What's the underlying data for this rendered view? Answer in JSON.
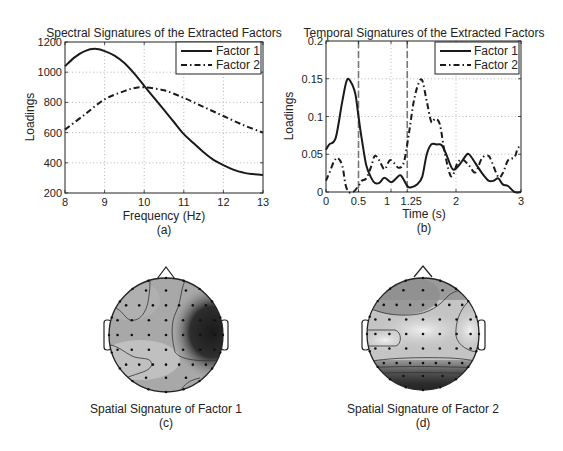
{
  "chart_data": [
    {
      "id": "a",
      "type": "line",
      "title": "Spectral Signatures of the Extracted Factors",
      "xlabel": "Frequency (Hz)",
      "ylabel": "Loadings",
      "caption": "(a)",
      "xlim": [
        8,
        13
      ],
      "ylim": [
        200,
        1200
      ],
      "xticks": [
        8,
        9,
        10,
        11,
        12,
        13
      ],
      "yticks": [
        200,
        400,
        600,
        800,
        1000,
        1200
      ],
      "grid": true,
      "legend_position": "upper right",
      "series": [
        {
          "name": "Factor 1",
          "style": "solid",
          "x": [
            8,
            8.25,
            8.5,
            8.75,
            9,
            9.25,
            9.5,
            9.75,
            10,
            10.25,
            10.5,
            10.75,
            11,
            11.25,
            11.5,
            11.75,
            12,
            12.25,
            12.5,
            12.75,
            13
          ],
          "y": [
            1040,
            1100,
            1140,
            1155,
            1140,
            1110,
            1060,
            990,
            910,
            830,
            750,
            670,
            590,
            530,
            470,
            420,
            385,
            355,
            335,
            325,
            320
          ]
        },
        {
          "name": "Factor 2",
          "style": "dashdot",
          "x": [
            8,
            8.5,
            9,
            9.5,
            9.75,
            10,
            10.5,
            11,
            11.5,
            12,
            12.5,
            13
          ],
          "y": [
            620,
            720,
            820,
            875,
            895,
            900,
            880,
            830,
            770,
            710,
            650,
            600
          ]
        }
      ]
    },
    {
      "id": "b",
      "type": "line",
      "title": "Temporal Signatures of the Extracted Factors",
      "xlabel": "Time (s)",
      "ylabel": "Loadings",
      "caption": "(b)",
      "xlim": [
        0,
        3
      ],
      "ylim": [
        0,
        0.2
      ],
      "xticks": [
        0,
        0.5,
        1,
        1.25,
        2,
        3
      ],
      "xtick_labels": [
        "0",
        "0.5",
        "1",
        "1.25",
        "2",
        "3"
      ],
      "yticks": [
        0,
        0.05,
        0.1,
        0.15,
        0.2
      ],
      "ytick_labels": [
        "0",
        "0.05",
        "0.1",
        "0.15",
        "0.2"
      ],
      "grid": true,
      "vertical_markers": [
        0.5,
        1.25
      ],
      "legend_position": "upper right",
      "series": [
        {
          "name": "Factor 1",
          "style": "solid",
          "x": [
            0,
            0.05,
            0.15,
            0.25,
            0.32,
            0.38,
            0.45,
            0.5,
            0.55,
            0.62,
            0.7,
            0.75,
            0.82,
            0.9,
            1.0,
            1.08,
            1.15,
            1.25,
            1.3,
            1.4,
            1.48,
            1.55,
            1.62,
            1.7,
            1.78,
            1.85,
            1.95,
            2.05,
            2.15,
            2.2,
            2.3,
            2.4,
            2.5,
            2.58,
            2.65,
            2.72,
            2.8,
            2.9,
            3.0
          ],
          "y": [
            0.056,
            0.063,
            0.072,
            0.12,
            0.148,
            0.146,
            0.13,
            0.1,
            0.07,
            0.035,
            0.018,
            0.012,
            0.012,
            0.019,
            0.013,
            0.018,
            0.022,
            0.008,
            0.006,
            0.01,
            0.02,
            0.05,
            0.063,
            0.063,
            0.062,
            0.05,
            0.03,
            0.036,
            0.048,
            0.05,
            0.038,
            0.025,
            0.015,
            0.015,
            0.018,
            0.01,
            0.008,
            0.0,
            0.0
          ]
        },
        {
          "name": "Factor 2",
          "style": "dashdot",
          "x": [
            0,
            0.05,
            0.12,
            0.18,
            0.25,
            0.3,
            0.35,
            0.42,
            0.5,
            0.55,
            0.62,
            0.7,
            0.75,
            0.82,
            0.9,
            0.98,
            1.05,
            1.12,
            1.2,
            1.28,
            1.35,
            1.42,
            1.48,
            1.55,
            1.62,
            1.68,
            1.75,
            1.82,
            1.9,
            1.95,
            2.02,
            2.1,
            2.2,
            2.3,
            2.4,
            2.5,
            2.55,
            2.65,
            2.72,
            2.8,
            2.9,
            2.95,
            3.0
          ],
          "y": [
            0.015,
            0.025,
            0.04,
            0.045,
            0.035,
            0.01,
            0.0,
            0.0,
            0.008,
            0.015,
            0.018,
            0.035,
            0.048,
            0.042,
            0.03,
            0.042,
            0.038,
            0.032,
            0.04,
            0.08,
            0.12,
            0.143,
            0.148,
            0.12,
            0.093,
            0.097,
            0.09,
            0.055,
            0.025,
            0.022,
            0.038,
            0.043,
            0.035,
            0.026,
            0.045,
            0.048,
            0.04,
            0.02,
            0.025,
            0.042,
            0.046,
            0.058,
            0.06
          ]
        }
      ]
    },
    {
      "id": "c",
      "type": "heatmap",
      "title": "Spatial Signature of Factor 1",
      "caption": "(c)",
      "description": "Scalp topographic map; darkest region on right temporal/parietal area, light region lower-left."
    },
    {
      "id": "d",
      "type": "heatmap",
      "title": "Spatial Signature of Factor 2",
      "caption": "(d)",
      "description": "Scalp topographic map; darkest region at occipital (bottom), lightest in central and left/right lateral areas."
    }
  ],
  "labels": {
    "a_title": "Spectral Signatures of the Extracted Factors",
    "a_xlabel": "Frequency (Hz)",
    "a_ylabel": "Loadings",
    "a_caption": "(a)",
    "b_title": "Temporal Signatures of the Extracted Factors",
    "b_xlabel": "Time (s)",
    "b_ylabel": "Loadings",
    "b_caption": "(b)",
    "c_title": "Spatial Signature of Factor 1",
    "c_caption": "(c)",
    "d_title": "Spatial Signature of Factor 2",
    "d_caption": "(d)",
    "legend_f1": "Factor 1",
    "legend_f2": "Factor 2"
  },
  "colors": {
    "line": "#1a1a1a",
    "grid": "#9a9a9a",
    "marker": "#777777"
  }
}
